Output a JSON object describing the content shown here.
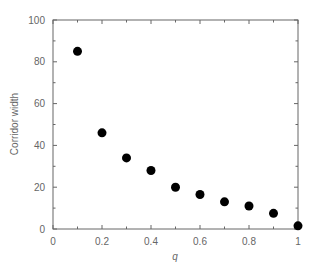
{
  "chart_data": {
    "type": "scatter",
    "title": "",
    "xlabel": "q",
    "ylabel": "Corridor width",
    "xlim": [
      0,
      1
    ],
    "ylim": [
      0,
      100
    ],
    "x_ticks": [
      0,
      0.2,
      0.4,
      0.6,
      0.8,
      1
    ],
    "x_tick_labels": [
      "0",
      "0.2",
      "0.4",
      "0.6",
      "0.8",
      "1"
    ],
    "y_ticks": [
      0,
      20,
      40,
      60,
      80,
      100
    ],
    "y_tick_labels": [
      "0",
      "20",
      "40",
      "60",
      "80",
      "100"
    ],
    "grid": false,
    "legend": null,
    "series": [
      {
        "name": "Corridor width",
        "marker": "filled-circle",
        "color": "#000000",
        "x": [
          0.1,
          0.2,
          0.3,
          0.4,
          0.5,
          0.6,
          0.7,
          0.8,
          0.9,
          1.0
        ],
        "y": [
          85,
          46,
          34,
          28,
          20,
          16.5,
          13,
          11,
          7.5,
          1.5
        ]
      }
    ]
  },
  "colors": {
    "axis": "#666666",
    "marker": "#000000",
    "background": "#ffffff"
  }
}
